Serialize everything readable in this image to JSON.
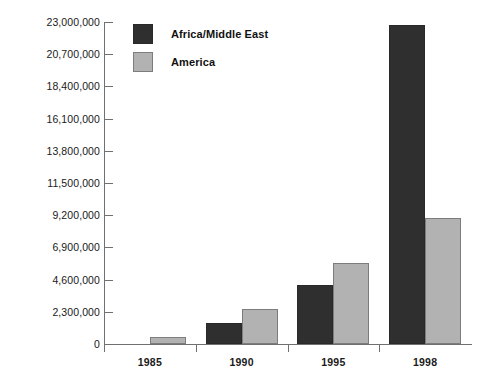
{
  "chart_data": {
    "type": "bar",
    "title": "",
    "subtitle": "",
    "xlabel": "",
    "ylabel": "",
    "categories": [
      "1985",
      "1990",
      "1995",
      "1998"
    ],
    "series": [
      {
        "name": "Africa/Middle East",
        "color": "#302f2f",
        "values": [
          0,
          1500000,
          4200000,
          22800000
        ]
      },
      {
        "name": "America",
        "color": "#b2b2b2",
        "values": [
          500000,
          2500000,
          5800000,
          9000000
        ]
      }
    ],
    "ylim": [
      0,
      23000000
    ],
    "ytick_values": [
      0,
      2300000,
      4600000,
      6900000,
      9200000,
      11500000,
      13800000,
      16100000,
      18400000,
      20700000,
      23000000
    ],
    "ytick_labels": [
      "0",
      "2,300,000",
      "4,600,000",
      "6,900,000",
      "9,200,000",
      "11,500,000",
      "13,800,000",
      "16,100,000",
      "18,400,000",
      "20,700,000",
      "23,000,000"
    ],
    "xtick_labels": [
      "1985",
      "1990",
      "1995",
      "1998"
    ],
    "grid": false,
    "legend_position": "top-left",
    "legend_entries": [
      "Africa/Middle East",
      "America"
    ],
    "background_color": "#ffffff",
    "axis_color": "#707070"
  }
}
